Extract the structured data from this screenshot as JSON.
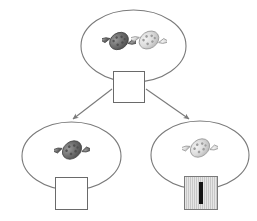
{
  "worksheet": {
    "type": "branching-tree-diagram",
    "title": "Candy sorting tree",
    "stroke_color": "#7a7a7a",
    "background_color": "#ffffff"
  },
  "nodes": {
    "parent": {
      "id": "parent-group",
      "label": "Parent group",
      "candy_count": 2,
      "candies": [
        {
          "name": "candy-dark",
          "color": "#6e6e6e",
          "pattern": "dotted-wrapper"
        },
        {
          "name": "candy-light",
          "color": "#d8d8d8",
          "pattern": "dotted-wrapper"
        }
      ],
      "answer_box": {
        "name": "parent-answer-box",
        "value": "",
        "placeholder": "",
        "state": "empty",
        "focused": false,
        "fill_color": "#ffffff"
      }
    },
    "left_child": {
      "id": "left-group",
      "label": "Left group",
      "candy_count": 1,
      "candies": [
        {
          "name": "candy-dark",
          "color": "#6e6e6e",
          "pattern": "dotted-wrapper"
        }
      ],
      "answer_box": {
        "name": "left-answer-box",
        "value": "",
        "placeholder": "",
        "state": "empty",
        "focused": false,
        "fill_color": "#ffffff"
      }
    },
    "right_child": {
      "id": "right-group",
      "label": "Right group",
      "candy_count": 1,
      "candies": [
        {
          "name": "candy-light",
          "color": "#d8d8d8",
          "pattern": "dotted-wrapper"
        }
      ],
      "answer_box": {
        "name": "right-answer-box",
        "value": "",
        "placeholder": "",
        "state": "active",
        "focused": true,
        "fill_color": "#c8c8c8",
        "caret_color": "#151515"
      }
    }
  },
  "connectors": [
    {
      "name": "arrow-parent-to-left",
      "from": "parent-answer-box",
      "to": "left-group",
      "direction": "down-left",
      "arrowhead": true
    },
    {
      "name": "arrow-parent-to-right",
      "from": "parent-answer-box",
      "to": "right-group",
      "direction": "down-right",
      "arrowhead": true
    }
  ]
}
